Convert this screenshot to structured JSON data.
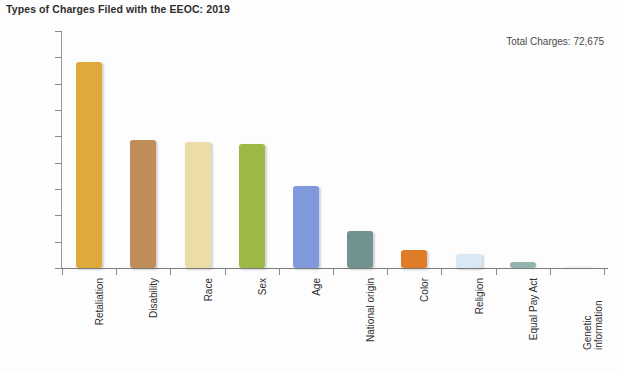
{
  "chart_data": {
    "type": "bar",
    "title": "Types of Charges Filed with the EEOC: 2019",
    "xlabel": "",
    "ylabel": "",
    "ylim": [
      0,
      45000
    ],
    "grid": false,
    "legend": "none",
    "annotation": "Total Charges: 72,675",
    "y_ticks": [
      "45,000",
      "40,000",
      "35,000",
      "30,000",
      "25,000",
      "20,000",
      "15,000",
      "10,000",
      "5,000",
      "0"
    ],
    "y_tick_values": [
      45000,
      40000,
      35000,
      30000,
      25000,
      20000,
      15000,
      10000,
      5000,
      0
    ],
    "categories": [
      "Retaliation",
      "Disability",
      "Race",
      "Sex",
      "Age",
      "National origin",
      "Color",
      "Religion",
      "Equal Pay Act",
      "Genetic information"
    ],
    "values": [
      39110,
      24238,
      23976,
      23532,
      15573,
      7009,
      3415,
      2725,
      1117,
      209
    ],
    "colors": [
      "#e0a93c",
      "#c08d5a",
      "#ebdca8",
      "#9cb845",
      "#8099dd",
      "#719290",
      "#e07c28",
      "#d8e9f5",
      "#93b3ae",
      "#f2f2f2"
    ]
  }
}
